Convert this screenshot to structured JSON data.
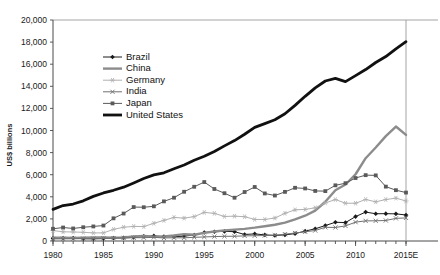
{
  "chart_data": {
    "type": "line",
    "title": "",
    "xlabel": "",
    "ylabel": "US$ billions",
    "xlim": [
      1980,
      2015
    ],
    "ylim": [
      0,
      20000
    ],
    "ytick_step": 2000,
    "ytick_labels": [
      "0",
      "2,000",
      "4,000",
      "6,000",
      "8,000",
      "10,000",
      "12,000",
      "14,000",
      "16,000",
      "18,000",
      "20,000"
    ],
    "ytick_values": [
      0,
      2000,
      4000,
      6000,
      8000,
      10000,
      12000,
      14000,
      16000,
      18000,
      20000
    ],
    "xtick_labels": [
      "1980",
      "1985",
      "1990",
      "1995",
      "2000",
      "2005",
      "2010",
      "2015E"
    ],
    "xtick_values": [
      1980,
      1985,
      1990,
      1995,
      2000,
      2005,
      2010,
      2015
    ],
    "minor_xticks_every": 1,
    "grid": false,
    "legend_position": "upper-left-inside",
    "x": [
      1980,
      1981,
      1982,
      1983,
      1984,
      1985,
      1986,
      1987,
      1988,
      1989,
      1990,
      1991,
      1992,
      1993,
      1994,
      1995,
      1996,
      1997,
      1998,
      1999,
      2000,
      2001,
      2002,
      2003,
      2004,
      2005,
      2006,
      2007,
      2008,
      2009,
      2010,
      2011,
      2012,
      2013,
      2014,
      2015
    ],
    "series": [
      {
        "name": "Brazil",
        "color": "#1a1a1a",
        "marker": "filled-diamond",
        "line_width": 1.0,
        "values": [
          235,
          259,
          272,
          203,
          198,
          216,
          270,
          290,
          320,
          426,
          462,
          407,
          390,
          438,
          546,
          770,
          840,
          871,
          844,
          587,
          644,
          554,
          504,
          552,
          669,
          892,
          1108,
          1397,
          1696,
          1667,
          2209,
          2616,
          2465,
          2473,
          2456,
          2353
        ]
      },
      {
        "name": "China",
        "color": "#8c8c8c",
        "marker": "none",
        "line_width": 2.4,
        "values": [
          303,
          289,
          284,
          305,
          310,
          310,
          301,
          327,
          409,
          461,
          399,
          413,
          495,
          617,
          562,
          734,
          863,
          962,
          1029,
          1094,
          1205,
          1339,
          1471,
          1660,
          1955,
          2286,
          2752,
          3552,
          4598,
          5110,
          6040,
          7492,
          8461,
          9490,
          10360,
          9600
        ]
      },
      {
        "name": "Germany",
        "color": "#b0b0b0",
        "marker": "open-star",
        "line_width": 1.0,
        "values": [
          946,
          832,
          815,
          786,
          734,
          735,
          1054,
          1247,
          1320,
          1307,
          1600,
          1867,
          2132,
          2069,
          2205,
          2587,
          2501,
          2219,
          2246,
          2199,
          1950,
          1950,
          2079,
          2506,
          2819,
          2861,
          3002,
          3440,
          3752,
          3418,
          3417,
          3757,
          3544,
          3753,
          3879,
          3620
        ]
      },
      {
        "name": "India",
        "color": "#707070",
        "marker": "small-cross",
        "line_width": 1.0,
        "values": [
          189,
          197,
          202,
          218,
          212,
          237,
          256,
          283,
          300,
          301,
          327,
          275,
          294,
          288,
          333,
          367,
          400,
          425,
          429,
          465,
          477,
          494,
          524,
          618,
          722,
          834,
          949,
          1239,
          1224,
          1366,
          1708,
          1823,
          1828,
          1857,
          2049,
          2090
        ]
      },
      {
        "name": "Japan",
        "color": "#5a5a5a",
        "marker": "filled-square",
        "line_width": 1.0,
        "values": [
          1105,
          1219,
          1135,
          1243,
          1318,
          1399,
          2052,
          2485,
          3072,
          3055,
          3140,
          3587,
          3918,
          4455,
          4907,
          5334,
          4707,
          4324,
          3915,
          4433,
          4888,
          4304,
          4115,
          4446,
          4815,
          4755,
          4530,
          4515,
          5038,
          5231,
          5700,
          5960,
          5938,
          4920,
          4600,
          4383
        ]
      },
      {
        "name": "United States",
        "color": "#111111",
        "marker": "none",
        "line_width": 2.8,
        "values": [
          2863,
          3211,
          3345,
          3638,
          4041,
          4347,
          4590,
          4870,
          5253,
          5658,
          5980,
          6174,
          6539,
          6879,
          7309,
          7664,
          8100,
          8609,
          9089,
          9661,
          10285,
          10622,
          10978,
          11511,
          12275,
          13094,
          13856,
          14478,
          14719,
          14419,
          14964,
          15518,
          16155,
          16692,
          17393,
          18037
        ]
      }
    ]
  },
  "legend": {
    "items": [
      {
        "label": "Brazil"
      },
      {
        "label": "China"
      },
      {
        "label": "Germany"
      },
      {
        "label": "India"
      },
      {
        "label": "Japan"
      },
      {
        "label": "United States"
      }
    ]
  }
}
